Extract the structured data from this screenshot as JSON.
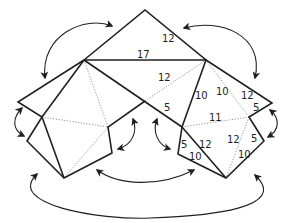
{
  "diagram": {
    "type": "folding-net",
    "colors": {
      "line": "#231f20",
      "fold_line": "#8a8a8a",
      "background": "#ffffff"
    },
    "labels": {
      "top_edge": "12",
      "top_base": "17",
      "center_upper": "12",
      "center_short": "5",
      "center_right_edge": "10",
      "right_upper_a": "10",
      "right_upper_b": "12",
      "right_tip": "5",
      "right_middle": "11",
      "lower_mid_left_5": "5",
      "lower_mid_left_12": "12",
      "lower_mid_left_10": "10",
      "lower_right_12": "12",
      "lower_right_5": "5",
      "lower_right_10": "10"
    },
    "arrows": [
      {
        "name": "top-left-join",
        "connects": "left slope of top triangle to left upper edge"
      },
      {
        "name": "top-right-join",
        "connects": "right slope of top triangle to right upper edge"
      },
      {
        "name": "left-side-join",
        "connects": "far-left notch edges"
      },
      {
        "name": "right-side-join",
        "connects": "far-right notch edges"
      },
      {
        "name": "center-left-join",
        "connects": "center notch left edges"
      },
      {
        "name": "center-right-join",
        "connects": "center notch right edges"
      },
      {
        "name": "bottom-inner-join",
        "connects": "inner lower edges"
      },
      {
        "name": "bottom-outer-join",
        "connects": "outer lower edges"
      }
    ]
  }
}
